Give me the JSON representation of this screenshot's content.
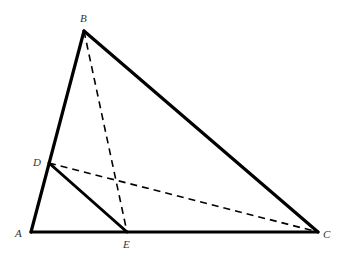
{
  "diagram": {
    "type": "geometry-triangle",
    "colors": {
      "stroke": "#000000",
      "label": "#333333",
      "background": "#ffffff"
    },
    "points": {
      "A": {
        "label": "A",
        "x": 31,
        "y": 232
      },
      "B": {
        "label": "B",
        "x": 84,
        "y": 31
      },
      "C": {
        "label": "C",
        "x": 318,
        "y": 232
      },
      "D": {
        "label": "D",
        "x": 49,
        "y": 163
      },
      "E": {
        "label": "E",
        "x": 127,
        "y": 232
      }
    },
    "solid_segments": [
      {
        "from": "A",
        "to": "B"
      },
      {
        "from": "B",
        "to": "C"
      },
      {
        "from": "A",
        "to": "C"
      },
      {
        "from": "D",
        "to": "E"
      }
    ],
    "dashed_segments": [
      {
        "from": "B",
        "to": "E"
      },
      {
        "from": "D",
        "to": "C"
      }
    ],
    "labels": {
      "A": "A",
      "B": "B",
      "C": "C",
      "D": "D",
      "E": "E"
    }
  }
}
